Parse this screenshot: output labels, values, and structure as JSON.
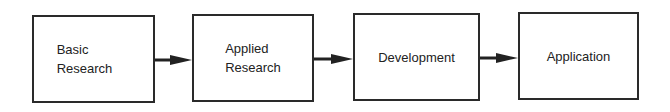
{
  "diagram": {
    "type": "flowchart",
    "direction": "left-to-right",
    "nodes": [
      {
        "id": "basic",
        "label": "Basic\nResearch"
      },
      {
        "id": "applied",
        "label": "Applied\nResearch"
      },
      {
        "id": "development",
        "label": "Development"
      },
      {
        "id": "application",
        "label": "Application"
      }
    ],
    "edges": [
      {
        "from": "basic",
        "to": "applied"
      },
      {
        "from": "applied",
        "to": "development"
      },
      {
        "from": "development",
        "to": "application"
      }
    ]
  }
}
